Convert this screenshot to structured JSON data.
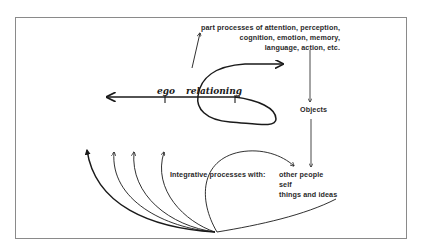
{
  "diagram": {
    "top_label": {
      "lines": [
        "part processes of attention, perception,",
        "cognition, emotion, memory,",
        "language, action, etc."
      ]
    },
    "center_axis": {
      "word_left": "ego",
      "word_right": "relationing"
    },
    "objects_label": "Objects",
    "integrative_label": "Integrative processes with:",
    "integrative_targets": [
      "other people",
      "self",
      "things and ideas"
    ],
    "colors": {
      "ink": "#1a1a1a",
      "frame": "#8a8a8a",
      "background": "#ffffff"
    }
  }
}
